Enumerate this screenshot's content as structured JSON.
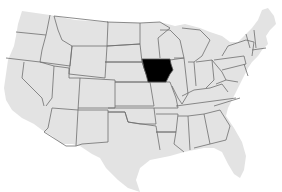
{
  "map": {
    "type": "us-states-locator",
    "highlighted_state": "Iowa",
    "highlight_color": "#000000",
    "land_color": "#e3e3e3",
    "border_color": "#6e6e6e",
    "background_color": "#ffffff"
  }
}
